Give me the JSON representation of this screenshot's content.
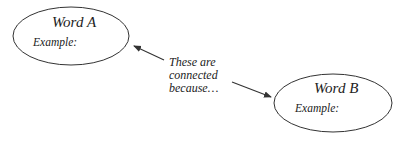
{
  "diagram": {
    "nodes": [
      {
        "id": "a",
        "title": "Word A",
        "example_label": "Example:"
      },
      {
        "id": "b",
        "title": "Word B",
        "example_label": "Example:"
      }
    ],
    "connector_text": {
      "line1": "These are",
      "line2": "connected",
      "line3": "because…"
    },
    "colors": {
      "stroke": "#333333",
      "text": "#222222",
      "background": "#ffffff"
    }
  }
}
